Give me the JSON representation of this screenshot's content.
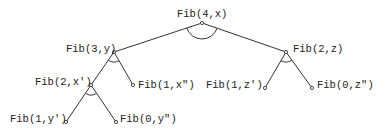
{
  "diagram": {
    "type": "and-tree",
    "nodes": [
      {
        "id": "n0",
        "label": "Fib(4,x)",
        "x": 202,
        "y": 23,
        "label_x": 177,
        "label_y": 17,
        "anchor": "start"
      },
      {
        "id": "n1",
        "label": "Fib(3,y)",
        "x": 114,
        "y": 52,
        "label_x": 66,
        "label_y": 52,
        "anchor": "start"
      },
      {
        "id": "n2",
        "label": "Fib(2,z)",
        "x": 286,
        "y": 52,
        "label_x": 293,
        "label_y": 52,
        "anchor": "start"
      },
      {
        "id": "n3",
        "label": "Fib(2,x')",
        "x": 91,
        "y": 85,
        "label_x": 35,
        "label_y": 85,
        "anchor": "start"
      },
      {
        "id": "n4",
        "label": "Fib(1,x\")",
        "x": 133,
        "y": 85,
        "label_x": 138,
        "label_y": 88,
        "anchor": "start"
      },
      {
        "id": "n5",
        "label": "Fib(1,z')",
        "x": 265,
        "y": 88,
        "label_x": 206,
        "label_y": 88,
        "anchor": "start"
      },
      {
        "id": "n6",
        "label": "Fib(0,z\")",
        "x": 312,
        "y": 88,
        "label_x": 317,
        "label_y": 88,
        "anchor": "start"
      },
      {
        "id": "n7",
        "label": "Fib(1,y')",
        "x": 66,
        "y": 122,
        "label_x": 10,
        "label_y": 122,
        "anchor": "start"
      },
      {
        "id": "n8",
        "label": "Fib(0,y\")",
        "x": 116,
        "y": 122,
        "label_x": 120,
        "label_y": 122,
        "anchor": "start"
      }
    ],
    "edges": [
      [
        "n0",
        "n1"
      ],
      [
        "n0",
        "n2"
      ],
      [
        "n1",
        "n3"
      ],
      [
        "n1",
        "n4"
      ],
      [
        "n2",
        "n5"
      ],
      [
        "n2",
        "n6"
      ],
      [
        "n3",
        "n7"
      ],
      [
        "n3",
        "n8"
      ]
    ],
    "and_arcs": [
      "n0",
      "n1",
      "n2",
      "n3"
    ]
  }
}
